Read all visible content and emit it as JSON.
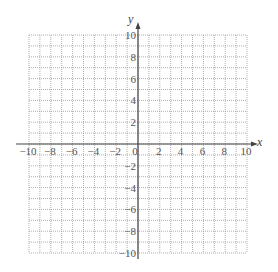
{
  "chart_data": {
    "type": "grid",
    "title": "",
    "xlabel": "x",
    "ylabel": "y",
    "xlim": [
      -10,
      10
    ],
    "ylim": [
      -10,
      10
    ],
    "grid": true,
    "grid_step": 1,
    "grid_style": "dotted",
    "x_tick_labels": [
      "-10",
      "-8",
      "-6",
      "-4",
      "-2",
      "0",
      "2",
      "4",
      "6",
      "8",
      "10"
    ],
    "y_tick_labels": [
      "10",
      "8",
      "6",
      "4",
      "2",
      "-2",
      "-4",
      "-6",
      "-8",
      "-10"
    ],
    "series": []
  },
  "colors": {
    "grid": "#9a9a9a",
    "axis": "#444444",
    "text": "#555555"
  }
}
